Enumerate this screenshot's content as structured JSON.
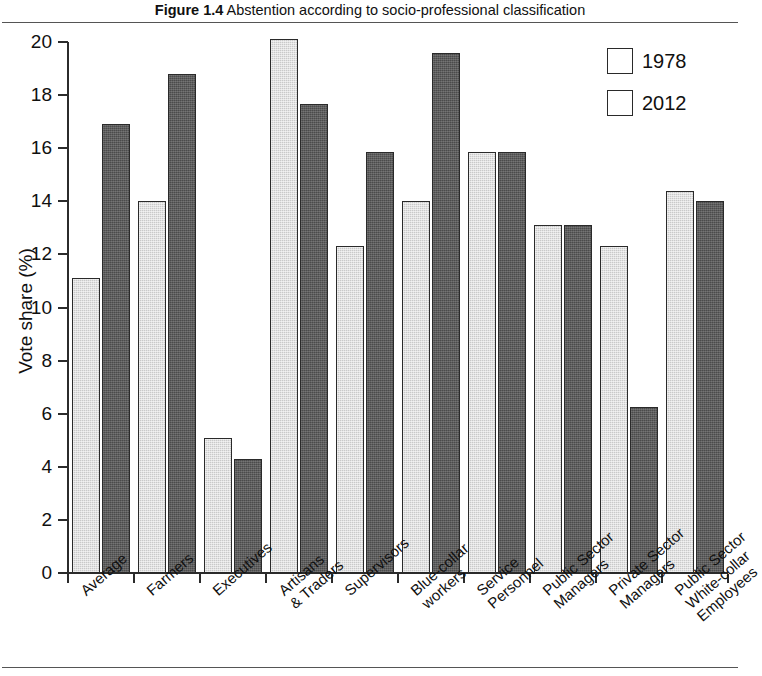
{
  "figure": {
    "number": "Figure 1.4",
    "caption": "Abstention according to socio-professional classification"
  },
  "legend": {
    "position": "top-right",
    "entries": [
      {
        "label": "1978",
        "color": "#c9c9c9"
      },
      {
        "label": "2012",
        "color": "#4b4b4b"
      }
    ]
  },
  "axes": {
    "ylabel": "Vote share (%)",
    "yticks": [
      "0",
      "2",
      "4",
      "6",
      "8",
      "10",
      "12",
      "14",
      "16",
      "18",
      "20"
    ]
  },
  "chart_data": {
    "type": "bar",
    "title": "Figure 1.4 Abstention according to socio-professional classification",
    "xlabel": "",
    "ylabel": "Vote share (%)",
    "ylim": [
      0,
      20
    ],
    "ytick_step": 2,
    "grid": false,
    "legend_position": "top-right",
    "categories": [
      "Average",
      "Farmers",
      "Executives",
      "Artisans\n& Traders",
      "Supervisors",
      "Blue-collar\nworkers",
      "Service\nPersonnel",
      "Public Sector\nManagers",
      "Private Sector\nManagers",
      "Public Sector\nWhite-collar\nEmployees"
    ],
    "series": [
      {
        "name": "1978",
        "color": "#c9c9c9",
        "values": [
          11.1,
          14.0,
          5.1,
          20.1,
          12.3,
          14.0,
          15.85,
          13.1,
          12.3,
          14.4
        ]
      },
      {
        "name": "2012",
        "color": "#4b4b4b",
        "values": [
          16.9,
          18.8,
          4.3,
          17.65,
          15.85,
          19.6,
          15.85,
          13.1,
          6.25,
          14.0
        ]
      }
    ]
  }
}
